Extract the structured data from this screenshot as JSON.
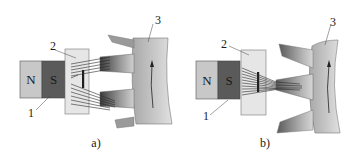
{
  "panels": [
    {
      "id": "a",
      "caption": "a)",
      "magnet": {
        "north_label": "N",
        "south_label": "S"
      },
      "callouts": {
        "magnet": "1",
        "sensor": "2",
        "rotor": "3"
      },
      "state": "gap between teeth facing sensor"
    },
    {
      "id": "b",
      "caption": "b)",
      "magnet": {
        "north_label": "N",
        "south_label": "S"
      },
      "callouts": {
        "magnet": "1",
        "sensor": "2",
        "rotor": "3"
      },
      "state": "tooth facing sensor"
    }
  ],
  "colors": {
    "north": "#c8c8c8",
    "south": "#5a5a5a",
    "sensor": "#e6e6e6",
    "rotor_light": "#d2d2d2",
    "rotor_dark": "#4a4a4a",
    "lines": "#2a2a2a"
  }
}
